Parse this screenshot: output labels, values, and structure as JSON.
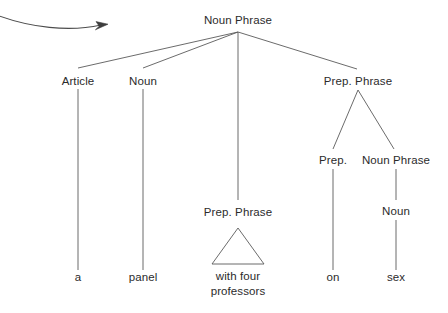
{
  "diagram": {
    "type": "constituency-tree",
    "background_color": "#ffffff",
    "line_color": "#5a5a5a",
    "text_color": "#2b2b2b",
    "annotation": {
      "arrow": {
        "name": "curved-pointer-arrow",
        "direction": "right",
        "start": [
          0,
          18
        ],
        "end": [
          108,
          26
        ]
      }
    },
    "nodes": [
      {
        "id": "np-root",
        "label": "Noun Phrase",
        "x": 238,
        "y": 20
      },
      {
        "id": "article",
        "label": "Article",
        "x": 78,
        "y": 81
      },
      {
        "id": "noun-1",
        "label": "Noun",
        "x": 143,
        "y": 81
      },
      {
        "id": "pp-right",
        "label": "Prep. Phrase",
        "x": 358,
        "y": 81
      },
      {
        "id": "pp-center",
        "label": "Prep. Phrase",
        "x": 238,
        "y": 212
      },
      {
        "id": "prep",
        "label": "Prep.",
        "x": 333,
        "y": 160
      },
      {
        "id": "np-inner",
        "label": "Noun Phrase",
        "x": 396,
        "y": 160
      },
      {
        "id": "noun-2",
        "label": "Noun",
        "x": 396,
        "y": 211
      }
    ],
    "terminals": [
      {
        "id": "term-a",
        "label": "a",
        "x": 78,
        "y": 277
      },
      {
        "id": "term-panel",
        "label": "panel",
        "x": 143,
        "y": 277
      },
      {
        "id": "term-with",
        "label": "with four\nprofessors",
        "x": 238,
        "y": 277,
        "lines": [
          "with four",
          "professors"
        ]
      },
      {
        "id": "term-on",
        "label": "on",
        "x": 333,
        "y": 277
      },
      {
        "id": "term-sex",
        "label": "sex",
        "x": 396,
        "y": 277
      }
    ],
    "triangle": {
      "id": "ellipsis-triangle",
      "apex": [
        238,
        228
      ],
      "base_left": [
        212,
        264
      ],
      "base_right": [
        264,
        264
      ]
    },
    "edges": [
      {
        "from": "np-root",
        "to": "article",
        "points": "238,32 78,68"
      },
      {
        "from": "np-root",
        "to": "noun-1",
        "points": "238,32 143,68"
      },
      {
        "from": "np-root",
        "to": "pp-center",
        "points": "238,32 238,200"
      },
      {
        "from": "np-root",
        "to": "pp-right",
        "points": "238,32 357,69"
      },
      {
        "from": "article",
        "to": "term-a",
        "points": "78,89 78,270"
      },
      {
        "from": "noun-1",
        "to": "term-panel",
        "points": "143,89 143,270"
      },
      {
        "from": "pp-right",
        "to": "prep",
        "points": "358,90 333,149"
      },
      {
        "from": "pp-right",
        "to": "np-inner",
        "points": "358,90 394,149"
      },
      {
        "from": "prep",
        "to": "term-on",
        "points": "333,169 333,270"
      },
      {
        "from": "np-inner",
        "to": "noun-2",
        "points": "396,169 396,200"
      },
      {
        "from": "noun-2",
        "to": "term-sex",
        "points": "396,220 396,270"
      }
    ]
  }
}
